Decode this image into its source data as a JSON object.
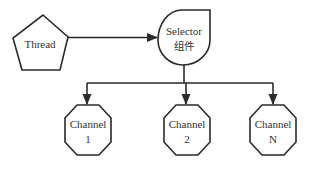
{
  "diagram": {
    "type": "flowchart",
    "colors": {
      "stroke": "#2a2a2a",
      "fill": "#ffffff",
      "text": "#333333"
    },
    "nodes": [
      {
        "id": "thread",
        "shape": "pentagon",
        "label": "Thread"
      },
      {
        "id": "selector",
        "shape": "teardrop",
        "label_line1": "Selector",
        "label_line2": "组件"
      },
      {
        "id": "channel1",
        "shape": "octagon",
        "label_line1": "Channel",
        "label_line2": "1"
      },
      {
        "id": "channel2",
        "shape": "octagon",
        "label_line1": "Channel",
        "label_line2": "2"
      },
      {
        "id": "channelN",
        "shape": "octagon",
        "label_line1": "Channel",
        "label_line2": "N"
      }
    ],
    "edges": [
      {
        "from": "thread",
        "to": "selector"
      },
      {
        "from": "selector",
        "to": "channel1"
      },
      {
        "from": "selector",
        "to": "channel2"
      },
      {
        "from": "selector",
        "to": "channelN"
      }
    ]
  }
}
